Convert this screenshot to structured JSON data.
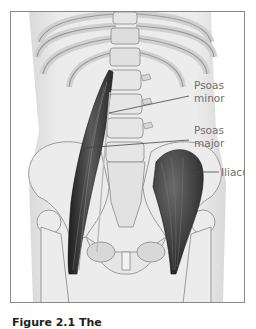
{
  "figure": {
    "labels": [
      {
        "id": "psoas-minor",
        "line1": "Psoas",
        "line2": "minor"
      },
      {
        "id": "psoas-major",
        "line1": "Psoas",
        "line2": "major"
      },
      {
        "id": "iliacus",
        "line1": "Iliacus"
      }
    ],
    "caption": "Figure 2.1 The"
  },
  "colors": {
    "bone": "#ebebeb",
    "bone_outline": "#9a9a9a",
    "muscle": "#3a3a3a",
    "body_shade": "#e2e2e2",
    "frame_border": "#8a8a8a",
    "label_text": "#6f6f6f"
  }
}
